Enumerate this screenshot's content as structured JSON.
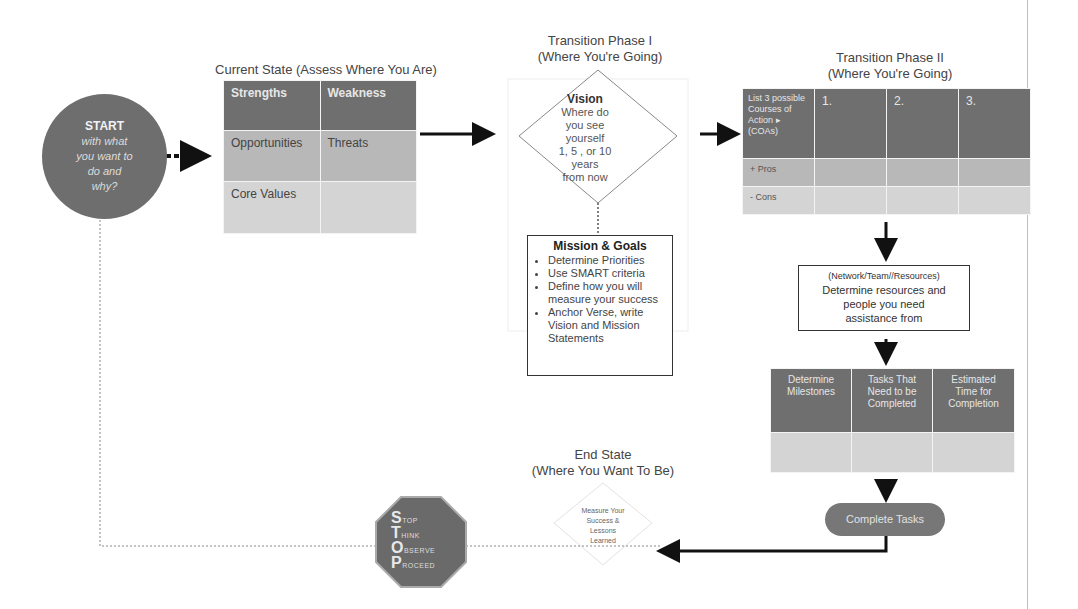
{
  "start": {
    "heading": "START",
    "lines": [
      "with what",
      "you want to",
      "do and",
      "why?"
    ]
  },
  "current_state": {
    "title": "Current State (Assess Where You Are)",
    "grid": [
      [
        "Strengths",
        "Weakness"
      ],
      [
        "Opportunities",
        "Threats"
      ],
      [
        "Core Values",
        ""
      ]
    ]
  },
  "transition_1": {
    "title_line1": "Transition Phase I",
    "title_line2": "(Where You're Going)",
    "vision": {
      "heading": "Vision",
      "lines": [
        "Where do",
        "you see",
        "yourself",
        "1, 5 , or 10",
        "years",
        "from now"
      ]
    },
    "mission": {
      "heading": "Mission & Goals",
      "bullets": [
        "Determine Priorities",
        "Use SMART criteria",
        "Define how you will measure your success",
        "Anchor Verse, write Vision and Mission Statements"
      ]
    }
  },
  "transition_2": {
    "title_line1": "Transition Phase II",
    "title_line2": "(Where You're Going)",
    "coa_table": {
      "header": [
        "List 3 possible Courses of Action ▸ (COAs)",
        "1.",
        "2.",
        "3."
      ],
      "rows": [
        [
          "+ Pros",
          "",
          "",
          ""
        ],
        [
          "- Cons",
          "",
          "",
          ""
        ]
      ]
    },
    "network": {
      "line1": "(Network/Team//Resources)",
      "line2": "Determine resources and",
      "line3": "people you need",
      "line4": "assistance from"
    },
    "milestones_table": {
      "header": [
        "Determine Milestones",
        "Tasks That Need to be Completed",
        "Estimated Time for Completion"
      ],
      "rows": [
        [
          "",
          "",
          ""
        ]
      ]
    },
    "complete": "Complete Tasks"
  },
  "end_state": {
    "title_line1": "End State",
    "title_line2": "(Where You Want To Be)",
    "measure": [
      "Measure Your",
      "Success &",
      "Lessons",
      "Learned"
    ]
  },
  "stop_sign": {
    "rows": [
      {
        "cap": "S",
        "rest": "TOP"
      },
      {
        "cap": "T",
        "rest": "HINK"
      },
      {
        "cap": "O",
        "rest": "BSERVE"
      },
      {
        "cap": "P",
        "rest": "ROCEED"
      }
    ]
  },
  "colors": {
    "dark_cell": "#6f6f6f",
    "mid_cell": "#b8b8b8",
    "light_cell": "#d4d4d4",
    "arrow": "#111111"
  }
}
